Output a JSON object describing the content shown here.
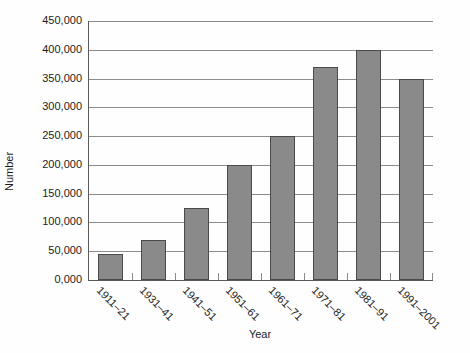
{
  "chart_data": {
    "type": "bar",
    "title": "",
    "xlabel": "Year",
    "ylabel": "Number",
    "categories": [
      "1911–21",
      "1931–41",
      "1941–51",
      "1951–61",
      "1961–71",
      "1971–81",
      "1981–91",
      "1991–2001"
    ],
    "values": [
      45000,
      70000,
      125000,
      200000,
      250000,
      370000,
      400000,
      350000
    ],
    "ylim": [
      0,
      450000
    ],
    "ytick_step": 50000,
    "ytick_labels": [
      "0,000",
      "50,000",
      "100,000",
      "150,000",
      "200,000",
      "250,000",
      "300,000",
      "350,000",
      "400,000",
      "450,000"
    ],
    "grid": true,
    "legend": "none",
    "colors": {
      "bar_fill": "#8a8a8a",
      "bar_border": "#4a4a4a",
      "gridline": "#8c8c8c",
      "axis": "#5a5a5a",
      "text": "#1c1c1c",
      "background": "#fefefe"
    }
  }
}
